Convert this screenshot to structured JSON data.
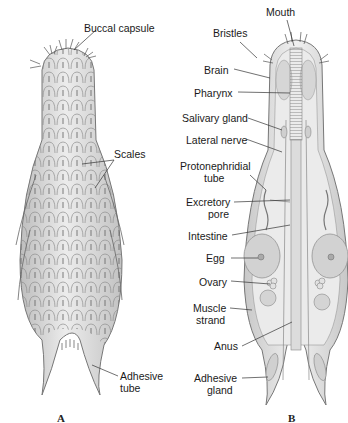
{
  "figure": {
    "panels": [
      {
        "id": "A",
        "letter": "A",
        "labels": [
          "Buccal capsule",
          "Scales",
          "Adhesive tube"
        ]
      },
      {
        "id": "B",
        "letter": "B",
        "labels": [
          "Mouth",
          "Bristles",
          "Brain",
          "Pharynx",
          "Salivary gland",
          "Lateral nerve",
          "Protonephridial tube",
          "Excretory pore",
          "Intestine",
          "Egg",
          "Ovary",
          "Muscle strand",
          "Anus",
          "Adhesive gland"
        ]
      }
    ]
  },
  "panelA": {
    "letter": "A",
    "buccal_capsule": "Buccal capsule",
    "scales": "Scales",
    "adhesive_tube_1": "Adhesive",
    "adhesive_tube_2": "tube"
  },
  "panelB": {
    "letter": "B",
    "mouth": "Mouth",
    "bristles": "Bristles",
    "brain": "Brain",
    "pharynx": "Pharynx",
    "salivary_gland": "Salivary gland",
    "lateral_nerve": "Lateral nerve",
    "protonephridial_1": "Protonephridial",
    "protonephridial_2": "tube",
    "excretory_1": "Excretory",
    "excretory_2": "pore",
    "intestine": "Intestine",
    "egg": "Egg",
    "ovary": "Ovary",
    "muscle_1": "Muscle",
    "muscle_2": "strand",
    "anus": "Anus",
    "adhesive_gland_1": "Adhesive",
    "adhesive_gland_2": "gland"
  },
  "colors": {
    "body_fill": "#e6e6e6",
    "body_stroke": "#7a7a7a",
    "leader": "#333333",
    "egg_fill": "#d0d0d0"
  }
}
